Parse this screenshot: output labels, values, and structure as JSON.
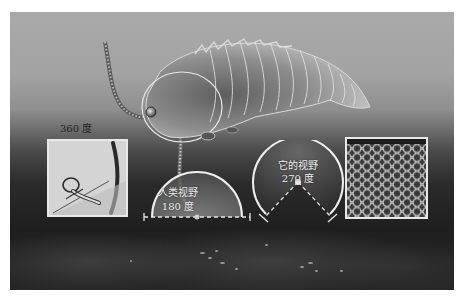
{
  "figure": {
    "labels": {
      "panel_left_angle": "360 度",
      "human_view_title": "人类视野",
      "human_view_angle": "180 度",
      "creature_view_title": "它的视野",
      "creature_view_angle": "270 度"
    },
    "panels": [
      {
        "name": "inner-ear-inset",
        "content": "line drawing of semicircular canals"
      },
      {
        "name": "human-fov-diagram",
        "angle_degrees": 180
      },
      {
        "name": "creature-fov-diagram",
        "angle_degrees": 270
      },
      {
        "name": "compound-eye-inset",
        "content": "compound eye facets close-up"
      }
    ],
    "colors": {
      "background_top": "#a9a9a9",
      "background_bottom": "#1f1f1f",
      "diagram_line": "#eeeeee",
      "panel_border": "#e8e8e8"
    }
  }
}
